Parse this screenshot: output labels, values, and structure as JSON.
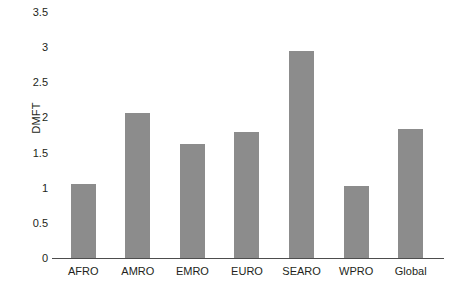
{
  "chart_data": {
    "type": "bar",
    "title": "",
    "subtitle": "",
    "xlabel": "",
    "ylabel": "DMFT",
    "categories": [
      "AFRO",
      "AMRO",
      "EMRO",
      "EURO",
      "SEARO",
      "WPRO",
      "Global"
    ],
    "values": [
      1.05,
      2.06,
      1.62,
      1.79,
      2.94,
      1.02,
      1.83
    ],
    "series": [
      {
        "name": "DMFT",
        "values": [
          1.05,
          2.06,
          1.62,
          1.79,
          2.94,
          1.02,
          1.83
        ]
      }
    ],
    "ylim": [
      0,
      3.5
    ],
    "y_ticks": [
      0,
      0.5,
      1,
      1.5,
      2,
      2.5,
      3,
      3.5
    ],
    "y_tick_labels": [
      "0",
      "0.5",
      "1",
      "1.5",
      "2",
      "2.5",
      "3",
      "3.5"
    ],
    "grid": false,
    "legend": null,
    "legend_position": "none",
    "annotations": [],
    "colors": {
      "bar": "#8c8c8c",
      "axis": "#4d4d4d",
      "text": "#231f20",
      "background": "#ffffff"
    }
  }
}
